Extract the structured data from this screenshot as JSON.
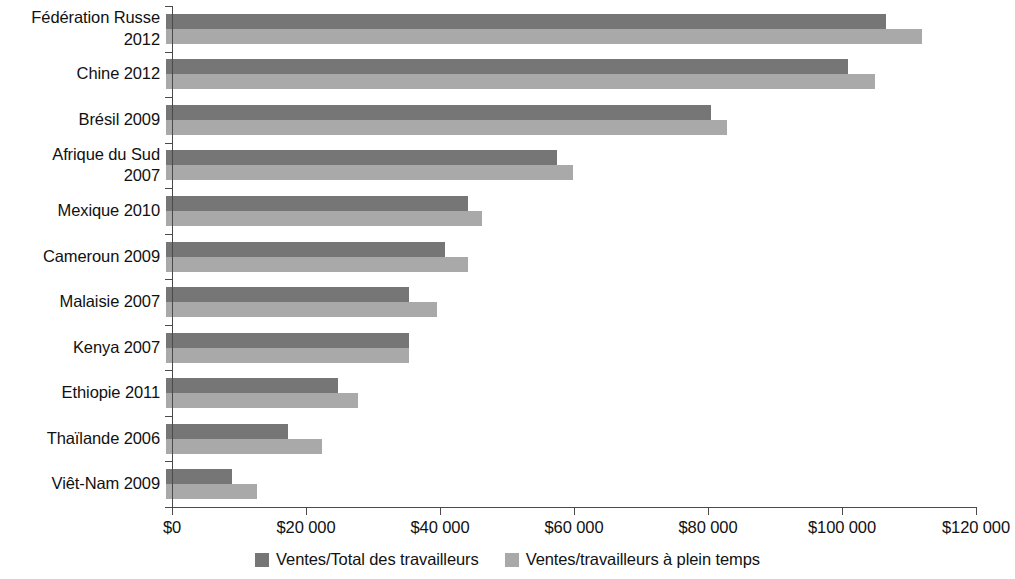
{
  "chart_data": {
    "type": "bar",
    "orientation": "horizontal",
    "title": "",
    "subtitle": "",
    "xlabel": "",
    "ylabel": "",
    "xlim": [
      0,
      120000
    ],
    "xticks": [
      0,
      20000,
      40000,
      60000,
      80000,
      100000,
      120000
    ],
    "xtick_labels": [
      "$0",
      "$20 000",
      "$40 000",
      "$60 000",
      "$80 000",
      "$100 000",
      "$120 000"
    ],
    "grid": false,
    "legend_position": "bottom",
    "categories": [
      "Fédération Russe\n2012",
      "Chine 2012",
      "Brésil 2009",
      "Afrique du Sud\n2007",
      "Mexique 2010",
      "Cameroun 2009",
      "Malaisie 2007",
      "Kenya 2007",
      "Ethiopie 2011",
      "Thaïlande 2006",
      "Viêt-Nam 2009"
    ],
    "series": [
      {
        "name": "Ventes/Total des travailleurs",
        "color": "#767676",
        "values": [
          107500,
          101800,
          81300,
          58300,
          45000,
          41700,
          36300,
          36300,
          25700,
          18200,
          9900
        ]
      },
      {
        "name": "Ventes/travailleurs à plein temps",
        "color": "#a9a9a9",
        "values": [
          112900,
          105800,
          83800,
          60700,
          47100,
          45000,
          40400,
          36300,
          28700,
          23300,
          13600
        ]
      }
    ]
  },
  "legend": {
    "items": [
      {
        "label": "Ventes/Total des travailleurs",
        "swatch": "dark-gray-swatch-icon"
      },
      {
        "label": "Ventes/travailleurs à plein temps",
        "swatch": "light-gray-swatch-icon"
      }
    ]
  }
}
